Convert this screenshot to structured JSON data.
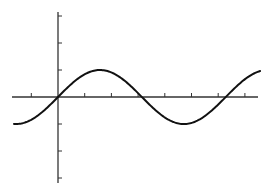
{
  "chart_data": {
    "type": "line",
    "title": "",
    "xlabel": "",
    "ylabel": "",
    "function": "y = sin(x)",
    "xlim": [
      -1.65,
      7.6
    ],
    "ylim": [
      -3.2,
      3.2
    ],
    "x_ticks": [
      -1,
      1,
      2,
      3,
      4,
      5,
      6,
      7
    ],
    "y_ticks": [
      -3,
      -2,
      -1,
      1,
      2,
      3
    ],
    "tick_labels_shown": false,
    "grid": false,
    "legend": null,
    "series": [
      {
        "name": "sin(x)",
        "x": [
          -1.65,
          -1.0,
          -0.5,
          0,
          0.5,
          1.0,
          1.5708,
          2.0,
          2.5,
          3.1416,
          3.5,
          4.0,
          4.7124,
          5.0,
          5.5,
          6.2832,
          6.5,
          7.0,
          7.57
        ],
        "values": [
          -0.997,
          -0.841,
          -0.479,
          0,
          0.479,
          0.841,
          1.0,
          0.909,
          0.598,
          0,
          -0.351,
          -0.757,
          -1.0,
          -0.959,
          -0.706,
          0,
          0.215,
          0.657,
          0.96
        ]
      }
    ],
    "colors": {
      "axis": "#333333",
      "curve": "#111111",
      "background": "#ffffff"
    }
  },
  "layout": {
    "origin_px": [
      58,
      97
    ],
    "x_unit_px": 26.7,
    "y_unit_px": 27,
    "x_axis_px": [
      12,
      258
    ],
    "y_axis_px": [
      12,
      183
    ]
  }
}
